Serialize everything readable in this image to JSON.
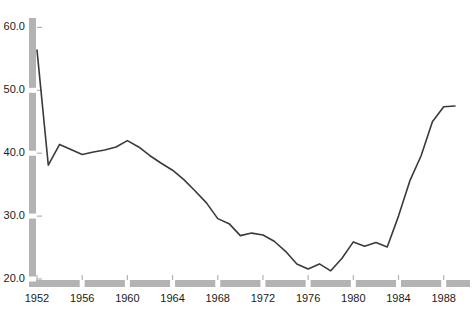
{
  "chart_data": {
    "type": "line",
    "title": "",
    "subtitle": "",
    "xlabel": "",
    "ylabel": "",
    "xlim": [
      1951.4,
      1989.6
    ],
    "ylim": [
      20.0,
      61.5
    ],
    "grid": false,
    "legend": null,
    "line_color": "#3a3a3a",
    "axis_color": "#b3b3b3",
    "background_color": "#ffffff",
    "y_ticks": [
      20.0,
      30.0,
      40.0,
      50.0,
      60.0
    ],
    "y_tick_labels": [
      "20.0",
      "30.0",
      "40.0",
      "50.0",
      "60.0"
    ],
    "x_ticks": [
      1952,
      1956,
      1960,
      1964,
      1968,
      1972,
      1976,
      1980,
      1984,
      1988
    ],
    "x_tick_labels": [
      "1952",
      "1956",
      "1960",
      "1964",
      "1968",
      "1972",
      "1976",
      "1980",
      "1984",
      "1988"
    ],
    "x": [
      1952,
      1953,
      1954,
      1955,
      1956,
      1957,
      1958,
      1959,
      1960,
      1961,
      1962,
      1963,
      1964,
      1965,
      1966,
      1967,
      1968,
      1969,
      1970,
      1971,
      1972,
      1973,
      1974,
      1975,
      1976,
      1977,
      1978,
      1979,
      1980,
      1981,
      1982,
      1983,
      1984,
      1985,
      1986,
      1987,
      1988,
      1989
    ],
    "values": [
      56.4,
      38.1,
      41.4,
      40.6,
      39.8,
      40.2,
      40.5,
      41.0,
      42.0,
      41.0,
      39.6,
      38.4,
      37.3,
      35.8,
      34.0,
      32.1,
      29.6,
      28.8,
      26.9,
      27.3,
      27.0,
      26.0,
      24.4,
      22.4,
      21.6,
      22.4,
      21.3,
      23.3,
      25.9,
      25.2,
      25.8,
      25.1,
      30.0,
      35.6,
      39.6,
      45.0,
      47.4,
      47.5
    ],
    "series_name": "value",
    "annotations": []
  },
  "axis": {
    "y_axis_name": "y-axis",
    "x_axis_name": "x-axis"
  }
}
